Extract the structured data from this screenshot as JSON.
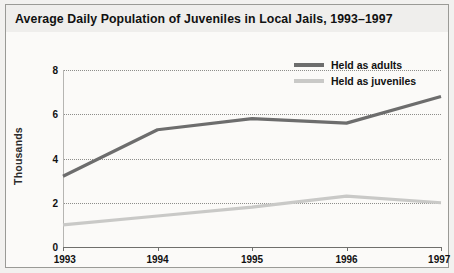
{
  "chart_data": {
    "type": "line",
    "title": "Average Daily Population of Juveniles in Local Jails, 1993–1997",
    "xlabel": "",
    "ylabel": "Thousands",
    "categories": [
      "1993",
      "1994",
      "1995",
      "1996",
      "1997"
    ],
    "x_tick_labels": [
      "1993",
      "1994",
      "1995",
      "1996",
      "1997"
    ],
    "y_tick_labels": [
      "0",
      "2",
      "4",
      "6",
      "8"
    ],
    "y_ticks": [
      0,
      2,
      4,
      6,
      8
    ],
    "ylim": [
      0,
      8
    ],
    "grid": "horizontal-dotted",
    "legend_position": "top-right",
    "series": [
      {
        "name": "Held as adults",
        "color": "#6d6d6d",
        "values": [
          3.2,
          5.3,
          5.8,
          5.6,
          6.8
        ]
      },
      {
        "name": "Held as juveniles",
        "color": "#c9c9c7",
        "values": [
          1.0,
          1.4,
          1.8,
          2.3,
          2.0
        ]
      }
    ]
  },
  "legend": {
    "items": [
      {
        "label": "Held as adults",
        "color": "#6d6d6d"
      },
      {
        "label": "Held as juveniles",
        "color": "#c9c9c7"
      }
    ]
  },
  "colors": {
    "adults": "#6d6d6d",
    "juveniles": "#c9c9c7",
    "gridline": "#8d8d8a",
    "axis": "#6f6f6c",
    "title_bar": "#efeeec",
    "frame_border": "#9a9a96",
    "plot_background": "#fbfaf8",
    "text": "#111111"
  }
}
